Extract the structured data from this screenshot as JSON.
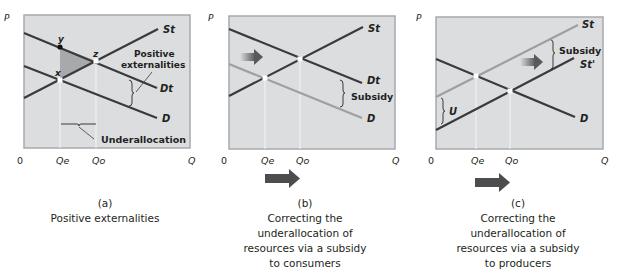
{
  "panels": [
    {
      "id": "a",
      "axis": {
        "y_label": "P",
        "origin": "0",
        "x_label": "Q",
        "qe": "Qe",
        "qo": "Qo"
      },
      "curves": {
        "st": "St",
        "dt": "Dt",
        "d": "D"
      },
      "points": {
        "y": "y",
        "z": "z",
        "x": "x"
      },
      "annotations": {
        "externalities_line1": "Positive",
        "externalities_line2": "externalities",
        "underallocation": "Underallocation"
      },
      "caption": {
        "letter": "(a)",
        "lines": [
          "Positive externalities"
        ]
      }
    },
    {
      "id": "b",
      "axis": {
        "y_label": "P",
        "origin": "0",
        "x_label": "Q",
        "qe": "Qe",
        "qo": "Qo"
      },
      "curves": {
        "st": "St",
        "dt": "Dt",
        "d": "D"
      },
      "annotations": {
        "subsidy": "Subsidy"
      },
      "caption": {
        "letter": "(b)",
        "lines": [
          "Correcting the",
          "underallocation of",
          "resources via a subsidy",
          "to consumers"
        ]
      }
    },
    {
      "id": "c",
      "axis": {
        "y_label": "P",
        "origin": "0",
        "x_label": "Q",
        "qe": "Qe",
        "qo": "Qo"
      },
      "curves": {
        "st": "St",
        "st_prime": "St'",
        "d": "D"
      },
      "annotations": {
        "subsidy": "Subsidy",
        "u": "U"
      },
      "caption": {
        "letter": "(c)",
        "lines": [
          "Correcting the",
          "underallocation of",
          "resources via a subsidy",
          "to producers"
        ]
      }
    }
  ],
  "colors": {
    "panel_bg": "#dcdddf",
    "panel_border": "#a7a9ac",
    "line_dark": "#3a3a3c",
    "line_light": "#9d9fa2",
    "shade": "#a7a9ac",
    "arrow": "#4d4d4f"
  }
}
